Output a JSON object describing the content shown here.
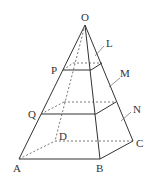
{
  "diagram": {
    "type": "square-pyramid-with-cross-sections",
    "stroke_color": "#333333",
    "labels": {
      "O": "O",
      "L": "L",
      "P": "P",
      "M": "M",
      "Q": "Q",
      "N": "N",
      "D": "D",
      "A": "A",
      "B": "B",
      "C": "C"
    }
  }
}
